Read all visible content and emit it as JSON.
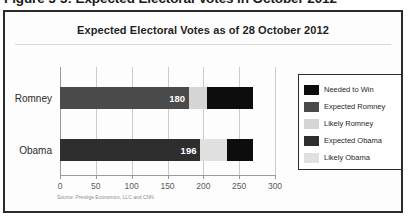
{
  "figure": {
    "caption": "Figure 5-3: Expected Electoral Votes in October 2012",
    "source_note": "Source: Prestige Economics, LLC and CNN"
  },
  "chart_data": {
    "type": "bar",
    "orientation": "horizontal",
    "stacked": true,
    "title": "Expected Electoral Votes as of 28 October 2012",
    "xlabel": "",
    "ylabel": "",
    "categories": [
      "Romney",
      "Obama"
    ],
    "xlim": [
      0,
      300
    ],
    "xticks": [
      0,
      50,
      100,
      150,
      200,
      250,
      300
    ],
    "xticklabels": [
      "0",
      "50",
      "100",
      "150",
      "200",
      "250",
      "300"
    ],
    "grid": true,
    "legend_position": "right",
    "legend": [
      {
        "label": "Needed to Win",
        "color": "#0d0d0d"
      },
      {
        "label": "Expected Romney",
        "color": "#4a4a4a"
      },
      {
        "label": "Likely Romney",
        "color": "#d5d5d5"
      },
      {
        "label": "Expected Obama",
        "color": "#2e2e2e"
      },
      {
        "label": "Likely Obama",
        "color": "#e0e0e0"
      }
    ],
    "series": [
      {
        "name": "Romney",
        "segments": [
          {
            "name": "Expected Romney",
            "value": 180,
            "color": "#4a4a4a",
            "label": "180"
          },
          {
            "name": "Likely Romney",
            "value": 25,
            "color": "#d5d5d5",
            "label": ""
          },
          {
            "name": "Needed to Win",
            "value": 65,
            "color": "#0d0d0d",
            "label": ""
          }
        ],
        "total": 270
      },
      {
        "name": "Obama",
        "segments": [
          {
            "name": "Expected Obama",
            "value": 196,
            "color": "#2e2e2e",
            "label": "196"
          },
          {
            "name": "Likely Obama",
            "value": 37,
            "color": "#e0e0e0",
            "label": ""
          },
          {
            "name": "Needed to Win",
            "value": 37,
            "color": "#0d0d0d",
            "label": ""
          }
        ],
        "total": 270
      }
    ]
  }
}
